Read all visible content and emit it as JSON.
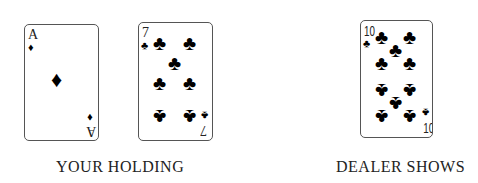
{
  "your_holding": {
    "label": "YOUR HOLDING",
    "cards": [
      {
        "rank": "A",
        "suit": "diamonds",
        "suit_glyph": "♦"
      },
      {
        "rank": "7",
        "suit": "clubs",
        "suit_glyph": "♣"
      }
    ]
  },
  "dealer_shows": {
    "label": "DEALER SHOWS",
    "cards": [
      {
        "rank": "10",
        "suit": "clubs",
        "suit_glyph": "♣"
      }
    ]
  }
}
